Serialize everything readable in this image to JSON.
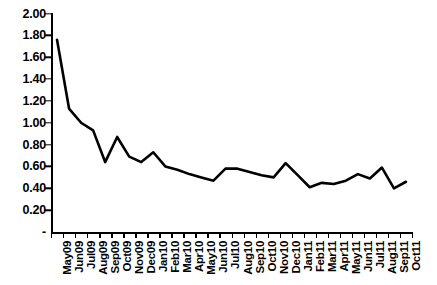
{
  "chart_data": {
    "type": "line",
    "title": "",
    "subtitle": "",
    "xlabel": "",
    "ylabel": "",
    "legend": [],
    "legend_position": "none",
    "grid": false,
    "ylim": [
      0.0,
      2.0
    ],
    "ytick_step": 0.2,
    "ytick_labels": [
      "2.00",
      "1.80",
      "1.60",
      "1.40",
      "1.20",
      "1.00",
      "0.80",
      "0.60",
      "0.40",
      "0.20",
      "-"
    ],
    "ytick_values": [
      2.0,
      1.8,
      1.6,
      1.4,
      1.2,
      1.0,
      0.8,
      0.6,
      0.4,
      0.2,
      0.0
    ],
    "zero_label_style": "accounting-dash",
    "categories": [
      "May09",
      "Jun09",
      "Jul09",
      "Aug09",
      "Sep09",
      "Oct09",
      "Nov09",
      "Dec09",
      "Jan10",
      "Feb10",
      "Mar10",
      "Apr10",
      "May10",
      "Jun10",
      "Jul10",
      "Aug10",
      "Sep10",
      "Oct10",
      "Nov10",
      "Dec10",
      "Jan11",
      "Feb11",
      "Mar11",
      "Apr11",
      "May11",
      "Jun11",
      "Jul11",
      "Aug11",
      "Sep11",
      "Oct11"
    ],
    "values": [
      1.76,
      1.13,
      1.0,
      0.93,
      0.64,
      0.87,
      0.69,
      0.64,
      0.73,
      0.6,
      0.57,
      0.53,
      0.5,
      0.47,
      0.58,
      0.58,
      0.55,
      0.52,
      0.5,
      0.63,
      0.52,
      0.41,
      0.45,
      0.44,
      0.47,
      0.53,
      0.49,
      0.59,
      0.4,
      0.46
    ],
    "series": [
      {
        "name": "series-1",
        "color": "#000000",
        "line_width": 2.6,
        "markers": false,
        "values": [
          1.76,
          1.13,
          1.0,
          0.93,
          0.64,
          0.87,
          0.69,
          0.64,
          0.73,
          0.6,
          0.57,
          0.53,
          0.5,
          0.47,
          0.58,
          0.58,
          0.55,
          0.52,
          0.5,
          0.63,
          0.52,
          0.41,
          0.45,
          0.44,
          0.47,
          0.53,
          0.49,
          0.59,
          0.4,
          0.46
        ]
      }
    ]
  },
  "colors": {
    "background": "#ffffff",
    "axis": "#000000",
    "line": "#000000",
    "text": "#000000"
  }
}
